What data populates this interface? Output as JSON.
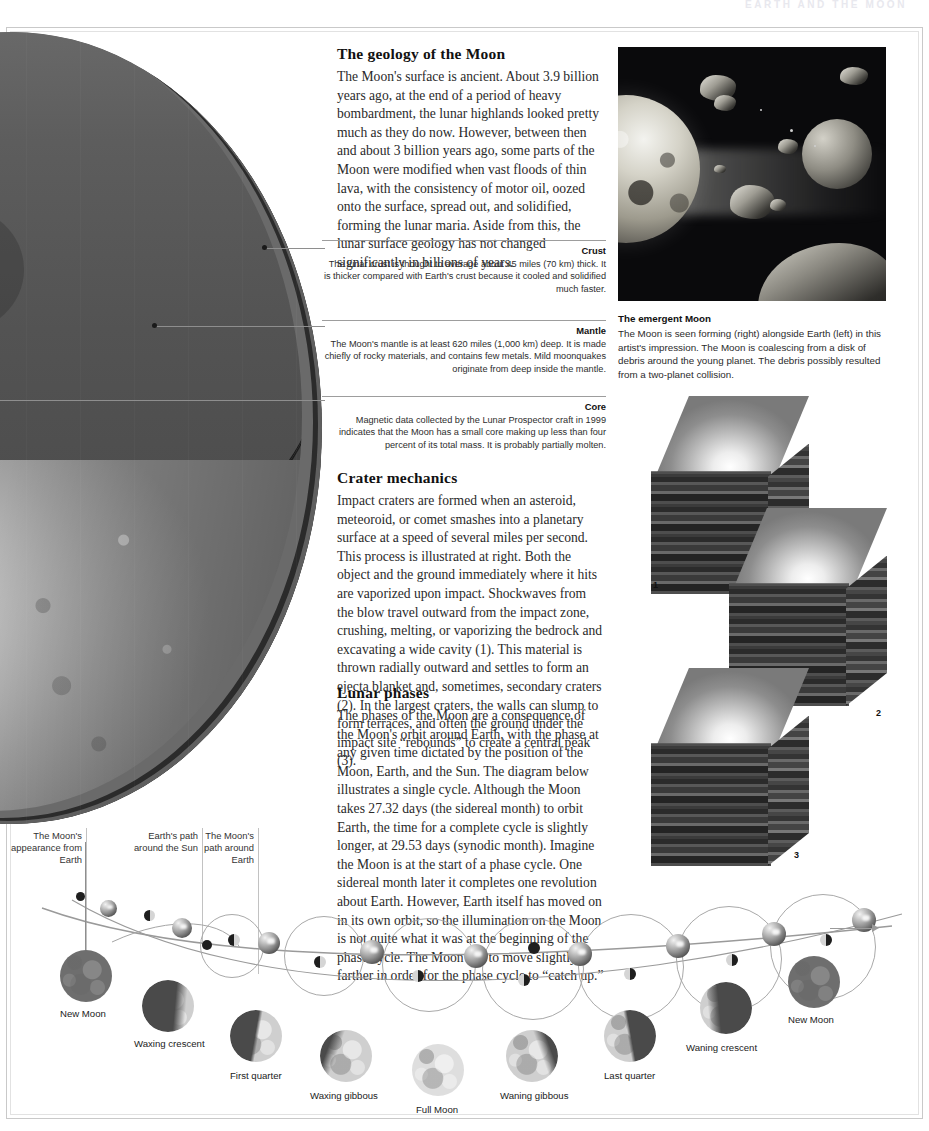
{
  "running_head": "EARTH AND THE MOON",
  "geology": {
    "title": "The geology of the Moon",
    "body": "The Moon's surface is ancient. About 3.9 billion years ago, at the end of a period of heavy bombardment, the lunar highlands looked pretty much as they do now. However, between then and about 3 billion years ago, some parts of the Moon were modified when vast floods of thin lava, with the consistency of motor oil, oozed onto the surface, spread out, and solidified, forming the lunar maria. Aside from this, the lunar surface geology has not changed significantly in billions of years."
  },
  "layers": [
    {
      "name": "Crust",
      "text": "The lunar crust is thought to average about 45 miles (70 km) thick. It is thicker compared with Earth's crust because it cooled and solidified much faster."
    },
    {
      "name": "Mantle",
      "text": "The Moon's mantle is at least 620 miles (1,000 km) deep. It is made chiefly of rocky materials, and contains few metals. Mild moonquakes originate from deep inside the mantle."
    },
    {
      "name": "Core",
      "text": "Magnetic data collected by the Lunar Prospector craft in 1999 indicates that the Moon has a small core making up less than four percent of its total mass. It is probably partially molten."
    }
  ],
  "crater": {
    "title": "Crater mechanics",
    "body": "Impact craters are formed when an asteroid, meteoroid, or comet smashes into a planetary surface at a speed of several miles per second. This process is illustrated at right. Both the object and the ground immediately where it hits are vaporized upon impact. Shockwaves from the blow travel outward from the impact zone, crushing, melting, or vaporizing the bedrock and excavating a wide cavity (1). This material is thrown radially outward and settles to form an ejecta blanket and, sometimes, secondary craters (2). In the largest craters, the walls can slump to form terraces, and often the ground under the impact site “rebounds” to create a central peak (3).",
    "step_numbers": [
      "1",
      "2",
      "3"
    ]
  },
  "phases_text": {
    "title": "Lunar phases",
    "body": "The phases of the Moon are a consequence of the Moon's orbit around Earth, with the phase at any given time dictated by the position of the Moon, Earth, and the Sun. The diagram below illustrates a single cycle. Although the Moon takes 27.32 days (the sidereal month) to orbit Earth, the time for a complete cycle is slightly longer, at 29.53 days (synodic month). Imagine the Moon is at the start of a phase cycle. One sidereal month later it completes one revolution about Earth. However, Earth itself has moved on in its own orbit, so the illumination on the Moon is not quite what it was at the beginning of the phase cycle. The Moon has to move slightly farther in order for the phase cycle to “catch up.”"
  },
  "emergent": {
    "caption_title": "The emergent Moon",
    "caption_body": "The Moon is seen forming (right) alongside Earth (left) in this artist's impression. The Moon is coalescing from a disk of debris around the young planet. The debris possibly resulted from a two-planet collision."
  },
  "diagram": {
    "annotations": [
      "The Moon's appearance from Earth",
      "Earth's path around the Sun",
      "The Moon's path around Earth"
    ],
    "phase_labels": [
      "New Moon",
      "Waxing crescent",
      "First quarter",
      "Waxing gibbous",
      "Full Moon",
      "Waning gibbous",
      "Last quarter",
      "Waning crescent",
      "New Moon"
    ]
  },
  "colors": {
    "page_bg": "#ffffff",
    "text": "#2a2a2a",
    "rule": "#9d9d9d",
    "frame": "#c9c9c9",
    "photo_bg": "#0a0a0c"
  }
}
